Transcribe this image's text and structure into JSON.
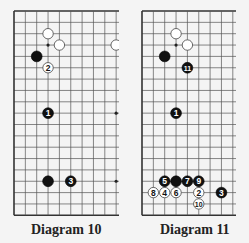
{
  "grid": {
    "spacing": 11.35,
    "rows": 19,
    "line_color": "#555555",
    "edge_color": "#333333"
  },
  "diagrams": [
    {
      "caption": "Diagram 10",
      "origin_x": 14,
      "origin_y": 11,
      "visible_cols": 10,
      "clip_right": 119,
      "bottom_row": 18,
      "hoshi": [
        [
          3,
          3
        ],
        [
          9,
          9
        ],
        [
          3,
          15
        ],
        [
          9,
          15
        ]
      ],
      "stones": [
        {
          "color": "white",
          "col": 3,
          "row": 2,
          "label": ""
        },
        {
          "color": "white",
          "col": 4,
          "row": 3,
          "label": ""
        },
        {
          "color": "white",
          "col": 9,
          "row": 3,
          "label": ""
        },
        {
          "color": "black",
          "col": 2,
          "row": 4,
          "label": ""
        },
        {
          "color": "white",
          "col": 3,
          "row": 5,
          "label": "2"
        },
        {
          "color": "black",
          "col": 3,
          "row": 9,
          "label": "1"
        },
        {
          "color": "black",
          "col": 3,
          "row": 15,
          "label": ""
        },
        {
          "color": "black",
          "col": 5,
          "row": 15,
          "label": "3"
        }
      ]
    },
    {
      "caption": "Diagram 11",
      "origin_x": 142,
      "origin_y": 11,
      "visible_cols": 9,
      "clip_right": 236,
      "bottom_row": 18,
      "hoshi": [
        [
          3,
          3
        ]
      ],
      "stones": [
        {
          "color": "white",
          "col": 3,
          "row": 2,
          "label": ""
        },
        {
          "color": "white",
          "col": 4,
          "row": 3,
          "label": ""
        },
        {
          "color": "black",
          "col": 2,
          "row": 4,
          "label": ""
        },
        {
          "color": "black",
          "col": 4,
          "row": 5,
          "label": "11"
        },
        {
          "color": "black",
          "col": 3,
          "row": 9,
          "label": "1"
        },
        {
          "color": "black",
          "col": 2,
          "row": 15,
          "label": "5"
        },
        {
          "color": "black",
          "col": 3,
          "row": 15,
          "label": ""
        },
        {
          "color": "black",
          "col": 4,
          "row": 15,
          "label": "7"
        },
        {
          "color": "black",
          "col": 5,
          "row": 15,
          "label": "9"
        },
        {
          "color": "white",
          "col": 1,
          "row": 16,
          "label": "8"
        },
        {
          "color": "white",
          "col": 2,
          "row": 16,
          "label": "4"
        },
        {
          "color": "white",
          "col": 3,
          "row": 16,
          "label": "6"
        },
        {
          "color": "white",
          "col": 5,
          "row": 16,
          "label": "2"
        },
        {
          "color": "black",
          "col": 7,
          "row": 16,
          "label": "3"
        },
        {
          "color": "white",
          "col": 5,
          "row": 17,
          "label": "10"
        }
      ]
    }
  ]
}
